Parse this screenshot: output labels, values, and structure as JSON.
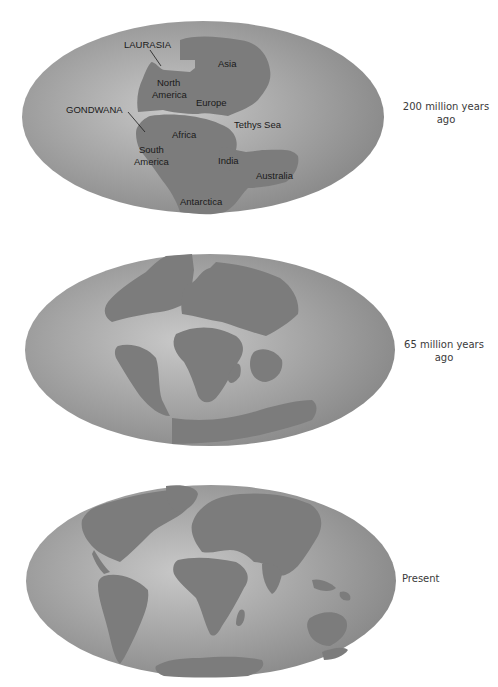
{
  "figure": {
    "panels": [
      {
        "id": "triassic",
        "era_label_line1": "200 million years",
        "era_label_line2": "ago",
        "map_labels": {
          "laurasia": "LAURASIA",
          "gondwana": "GONDWANA",
          "asia": "Asia",
          "north_america_1": "North",
          "north_america_2": "America",
          "europe": "Europe",
          "tethys_sea": "Tethys Sea",
          "africa": "Africa",
          "south_america_1": "South",
          "south_america_2": "America",
          "india": "India",
          "australia": "Australia",
          "antarctica": "Antarctica"
        }
      },
      {
        "id": "cretaceous",
        "era_label_line1": "65 million years",
        "era_label_line2": "ago"
      },
      {
        "id": "present",
        "era_label_line1": "Present"
      }
    ],
    "colors": {
      "ocean_light": "#c4c4c4",
      "ocean_dark": "#8e8e8e",
      "land": "#7a7a7a",
      "text": "#1a1a1a"
    }
  }
}
